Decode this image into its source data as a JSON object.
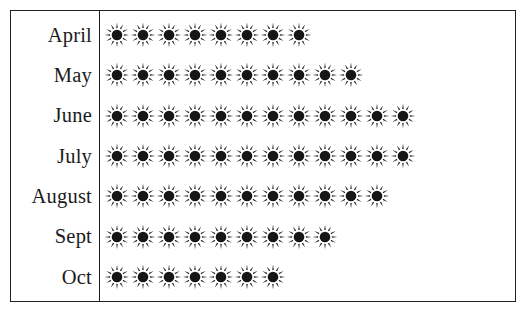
{
  "figure": {
    "type": "pictograph",
    "symbol_name": "sun-icon",
    "symbol_color": "#161616",
    "frame_color": "#222222",
    "background_color": "#ffffff"
  },
  "chart_data": {
    "type": "bar",
    "title": "",
    "subtitle": "",
    "xlabel": "",
    "ylabel": "",
    "categories": [
      "April",
      "May",
      "June",
      "July",
      "August",
      "Sept",
      "Oct"
    ],
    "values": [
      8,
      10,
      12,
      12,
      11,
      9,
      7
    ],
    "series": [
      {
        "name": "Sunny days",
        "values": [
          8,
          10,
          12,
          12,
          11,
          9,
          7
        ]
      }
    ],
    "symbol": "sun",
    "symbol_value": 1,
    "xlim": [
      0,
      14
    ],
    "grid": false,
    "legend": false,
    "legend_position": "none",
    "annotations": []
  },
  "rows": [
    {
      "label": "April",
      "count": 8
    },
    {
      "label": "May",
      "count": 10
    },
    {
      "label": "June",
      "count": 12
    },
    {
      "label": "July",
      "count": 12
    },
    {
      "label": "August",
      "count": 11
    },
    {
      "label": "Sept",
      "count": 9
    },
    {
      "label": "Oct",
      "count": 7
    }
  ]
}
